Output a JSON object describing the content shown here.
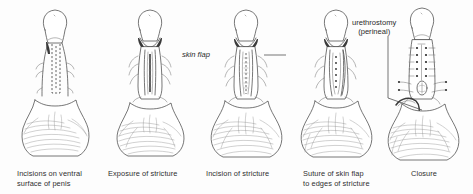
{
  "plate": {
    "title": "Urethral stricture repair — five-stage surgical sequence",
    "background_color": "#fdfdfd",
    "ink_color": "#4a4a4a",
    "text_color": "#2e2e2e"
  },
  "panels": [
    {
      "id": "panel-1",
      "step": 1,
      "caption": "Incisions on ventral\nsurface of penis",
      "art_name": "penis-ventral-incision-drawing"
    },
    {
      "id": "panel-2",
      "step": 2,
      "caption": "Exposure of stricture",
      "art_name": "stricture-exposure-drawing"
    },
    {
      "id": "panel-3",
      "step": 3,
      "caption": "Incision of stricture",
      "art_name": "stricture-incision-drawing"
    },
    {
      "id": "panel-4",
      "step": 4,
      "caption": "Suture of skin flap\nto edges of stricture",
      "art_name": "skin-flap-suture-drawing"
    },
    {
      "id": "panel-5",
      "step": 5,
      "caption": "Closure",
      "art_name": "closure-with-urethrostomy-drawing"
    }
  ],
  "annotations": [
    {
      "id": "skin-flap",
      "text": "skin flap",
      "style": "italic",
      "points_to": "panel-2"
    },
    {
      "id": "urethrostomy",
      "text": "urethrostomy\n(perineal)",
      "style": "roman",
      "points_to": "panel-5"
    }
  ]
}
